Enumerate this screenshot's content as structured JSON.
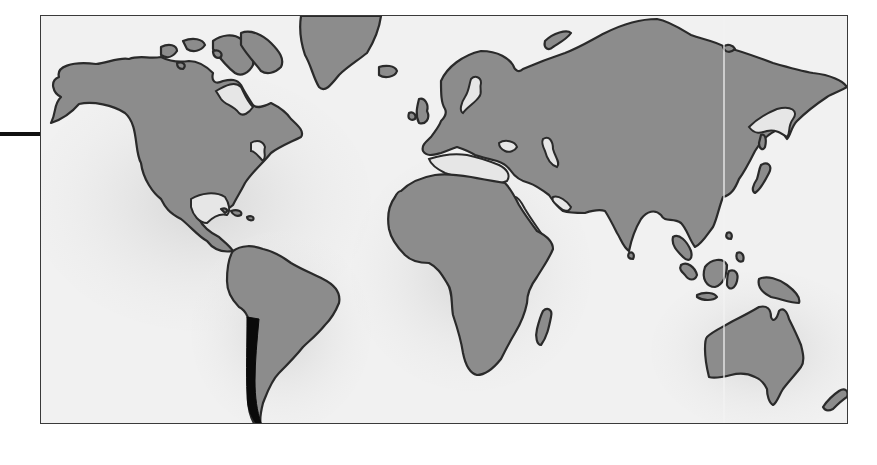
{
  "map": {
    "style": "grayscale illustrated world map",
    "projection": "equirectangular-like",
    "colors": {
      "ocean": "#f2f2f2",
      "ocean_shadow": "#d9d9d9",
      "land": "#8c8c8c",
      "coastline": "#2a2a2a",
      "highlight": "#0a0a0a",
      "frame": "#3a3a3a",
      "leader_line": "#111111"
    },
    "highlighted_region": "Chile",
    "continents": [
      "North America",
      "South America",
      "Greenland",
      "Europe",
      "Asia",
      "Africa",
      "Australia"
    ],
    "islands": [
      "Iceland",
      "British Isles",
      "Japan",
      "Madagascar",
      "New Zealand",
      "Indonesia",
      "Borneo",
      "Philippines",
      "Sri Lanka",
      "New Guinea",
      "Caribbean",
      "Canadian Arctic Archipelago",
      "Novaya Zemlya",
      "Wrangel Island"
    ],
    "water_features": [
      "Hudson Bay",
      "Great Lakes",
      "Gulf of Mexico",
      "Mediterranean Sea",
      "Black Sea",
      "Caspian Sea",
      "Red Sea",
      "Persian Gulf",
      "Baltic Sea"
    ],
    "annotations": {
      "leader_line": {
        "from_x": 0,
        "to_x": 41,
        "y": 134,
        "points_to": "map-frame-left-edge"
      }
    },
    "labels": []
  }
}
